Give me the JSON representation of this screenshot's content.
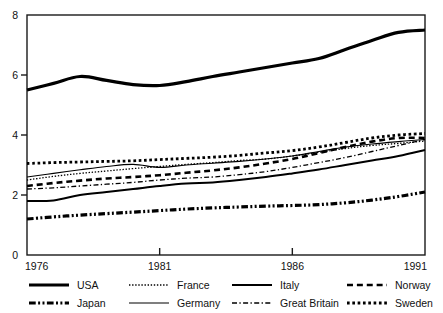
{
  "chart_data": {
    "type": "line",
    "title": "",
    "xlabel": "",
    "ylabel": "",
    "xlim": [
      1976,
      1991
    ],
    "ylim": [
      0,
      8
    ],
    "grid": false,
    "legend_position": "bottom",
    "x_ticks": [
      "1976",
      "1981",
      "1986",
      "1991"
    ],
    "x_tick_values": [
      1976,
      1981,
      1986,
      1991
    ],
    "y_ticks": [
      "0",
      "2",
      "4",
      "6",
      "8"
    ],
    "y_tick_values": [
      0,
      2,
      4,
      6,
      8
    ],
    "x": [
      1976,
      1977,
      1978,
      1979,
      1980,
      1981,
      1982,
      1983,
      1984,
      1985,
      1986,
      1987,
      1988,
      1989,
      1990,
      1991
    ],
    "series": [
      {
        "name": "USA",
        "style": "solid",
        "width": 3.2,
        "values": [
          5.5,
          5.72,
          5.95,
          5.82,
          5.68,
          5.65,
          5.78,
          5.95,
          6.1,
          6.25,
          6.4,
          6.55,
          6.85,
          7.15,
          7.42,
          7.5
        ]
      },
      {
        "name": "Japan",
        "style": "dash-dot-dot",
        "width": 3.2,
        "values": [
          1.2,
          1.27,
          1.33,
          1.38,
          1.43,
          1.48,
          1.53,
          1.57,
          1.6,
          1.63,
          1.65,
          1.68,
          1.74,
          1.83,
          1.95,
          2.1
        ]
      },
      {
        "name": "France",
        "style": "fine-dotted",
        "width": 1.3,
        "values": [
          2.5,
          2.62,
          2.72,
          2.8,
          2.88,
          2.95,
          3.02,
          3.08,
          3.15,
          3.2,
          3.3,
          3.42,
          3.55,
          3.65,
          3.72,
          3.8
        ]
      },
      {
        "name": "Germany",
        "style": "solid",
        "width": 1.1,
        "values": [
          2.6,
          2.72,
          2.84,
          2.95,
          3.02,
          2.92,
          3.0,
          3.06,
          3.12,
          3.2,
          3.3,
          3.45,
          3.6,
          3.7,
          3.78,
          3.85
        ]
      },
      {
        "name": "Italy",
        "style": "solid",
        "width": 2.0,
        "values": [
          1.8,
          1.82,
          2.0,
          2.1,
          2.2,
          2.3,
          2.38,
          2.42,
          2.5,
          2.6,
          2.72,
          2.85,
          3.0,
          3.15,
          3.3,
          3.5
        ]
      },
      {
        "name": "Great Britain",
        "style": "dash-dot",
        "width": 1.3,
        "values": [
          2.2,
          2.24,
          2.3,
          2.36,
          2.42,
          2.5,
          2.56,
          2.6,
          2.68,
          2.78,
          2.92,
          3.08,
          3.25,
          3.45,
          3.65,
          3.85
        ]
      },
      {
        "name": "Norway",
        "style": "dashed",
        "width": 2.6,
        "values": [
          2.3,
          2.4,
          2.48,
          2.55,
          2.6,
          2.66,
          2.74,
          2.82,
          2.92,
          3.05,
          3.2,
          3.4,
          3.6,
          3.78,
          3.9,
          3.9
        ]
      },
      {
        "name": "Sweden",
        "style": "dotted",
        "width": 2.8,
        "values": [
          3.05,
          3.08,
          3.1,
          3.12,
          3.14,
          3.18,
          3.22,
          3.26,
          3.32,
          3.4,
          3.48,
          3.6,
          3.75,
          3.9,
          4.0,
          4.05
        ]
      }
    ]
  },
  "legend": {
    "rows": [
      [
        {
          "label": "USA",
          "style": "solid",
          "width": 3.2
        },
        {
          "label": "France",
          "style": "fine-dotted",
          "width": 1.3
        },
        {
          "label": "Italy",
          "style": "solid",
          "width": 2.0
        },
        {
          "label": "Norway",
          "style": "dashed",
          "width": 2.6
        }
      ],
      [
        {
          "label": "Japan",
          "style": "dash-dot-dot",
          "width": 3.2
        },
        {
          "label": "Germany",
          "style": "solid",
          "width": 1.1
        },
        {
          "label": "Great Britain",
          "style": "dash-dot",
          "width": 1.3
        },
        {
          "label": "Sweden",
          "style": "dotted",
          "width": 2.8
        }
      ]
    ]
  },
  "colors": {
    "line": "#000000",
    "axis": "#1a1a1a",
    "text": "#111111",
    "background": "#ffffff"
  }
}
